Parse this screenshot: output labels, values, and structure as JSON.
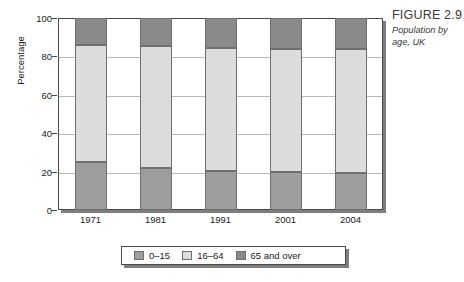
{
  "caption": {
    "title": "FIGURE 2.9",
    "subtitle": "Population by age, UK"
  },
  "chart_data": {
    "type": "bar",
    "stacked": true,
    "normalized": "percent",
    "title": "Population by age, UK",
    "xlabel": "",
    "ylabel": "Percentage",
    "ylim": [
      0,
      100
    ],
    "yticks": [
      0,
      20,
      40,
      60,
      80,
      100
    ],
    "grid": "horizontal",
    "legend_position": "bottom",
    "categories": [
      "1971",
      "1981",
      "1991",
      "2001",
      "2004"
    ],
    "series": [
      {
        "name": "0–15",
        "color": "#9e9e9e",
        "values": [
          25.0,
          22.0,
          20.5,
          20.0,
          19.5
        ]
      },
      {
        "name": "16–64",
        "color": "#dcdcdc",
        "values": [
          61.0,
          63.5,
          64.0,
          64.0,
          64.5
        ]
      },
      {
        "name": "65 and over",
        "color": "#8a8a8a",
        "values": [
          14.0,
          14.5,
          15.5,
          16.0,
          16.0
        ]
      }
    ]
  },
  "axes": {
    "y_title": "Percentage",
    "y_tick_labels": [
      "0",
      "20",
      "40",
      "60",
      "80",
      "100"
    ],
    "x_tick_labels": [
      "1971",
      "1981",
      "1991",
      "2001",
      "2004"
    ]
  },
  "legend": {
    "items": [
      {
        "label": "0–15",
        "color": "#9e9e9e"
      },
      {
        "label": "16–64",
        "color": "#dcdcdc"
      },
      {
        "label": "65 and over",
        "color": "#8a8a8a"
      }
    ]
  },
  "colors": {
    "frame": "#4a4a4a",
    "shadow": "#7e7e7e",
    "grid": "#b9b9b9",
    "background": "#ffffff",
    "text": "#1b1b1b"
  }
}
